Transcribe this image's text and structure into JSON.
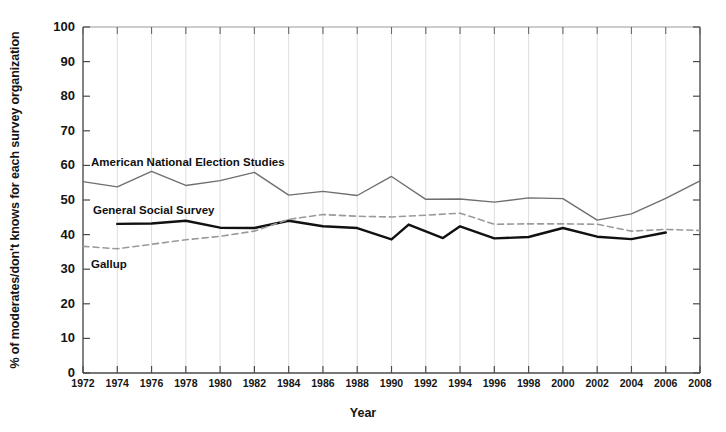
{
  "chart_data": {
    "type": "line",
    "title": "",
    "xlabel": "Year",
    "ylabel": "% of moderates/don't knows for each survey organization",
    "xlim": [
      1972,
      2008
    ],
    "ylim": [
      0,
      100
    ],
    "grid": "vertical-only",
    "legend_position": "inline-annotations",
    "x_tick_labels": [
      "1972",
      "1974",
      "1976",
      "1978",
      "1980",
      "1982",
      "1984",
      "1986",
      "1988",
      "1990",
      "1992",
      "1994",
      "1996",
      "1998",
      "2000",
      "2002",
      "2004",
      "2006",
      "2008"
    ],
    "y_tick_labels": [
      "0",
      "10",
      "20",
      "30",
      "40",
      "50",
      "60",
      "70",
      "80",
      "90",
      "100"
    ],
    "series": [
      {
        "name": "American National Election Studies",
        "style": "solid-thin",
        "color": "#6f6f6f",
        "x": [
          1972,
          1974,
          1976,
          1978,
          1980,
          1982,
          1984,
          1986,
          1988,
          1990,
          1992,
          1994,
          1996,
          1998,
          2000,
          2002,
          2004,
          2006,
          2008
        ],
        "values": [
          55.3,
          53.8,
          58.3,
          54.2,
          55.6,
          58.0,
          51.4,
          52.5,
          51.3,
          56.8,
          50.2,
          50.3,
          49.4,
          50.6,
          50.4,
          44.2,
          46.0,
          50.5,
          55.5
        ]
      },
      {
        "name": "General Social Survey",
        "style": "solid-thick",
        "color": "#111111",
        "x": [
          1974,
          1976,
          1978,
          1980,
          1982,
          1984,
          1986,
          1988,
          1990,
          1991,
          1993,
          1994,
          1996,
          1998,
          2000,
          2002,
          2004,
          2006
        ],
        "values": [
          43.1,
          43.2,
          44.0,
          42.0,
          41.9,
          44.0,
          42.4,
          41.9,
          38.6,
          42.9,
          39.0,
          42.4,
          38.9,
          39.3,
          41.9,
          39.4,
          38.7,
          40.6
        ],
        "note": "black solid line, annual-to-biennial points 1974-2006"
      },
      {
        "name": "Gallup",
        "style": "dashed",
        "color": "#9a9a9a",
        "x": [
          1972,
          1974,
          1976,
          1978,
          1980,
          1982,
          1984,
          1986,
          1988,
          1990,
          1992,
          1994,
          1996,
          1998,
          2000,
          2002,
          2004,
          2006,
          2008
        ],
        "values": [
          36.6,
          35.9,
          37.2,
          38.5,
          39.5,
          41.0,
          44.4,
          45.8,
          45.3,
          45.1,
          45.6,
          46.2,
          43.0,
          43.1,
          43.1,
          43.0,
          41.0,
          41.5,
          41.2
        ]
      }
    ],
    "annotations": [
      {
        "text": "American National Election Studies",
        "x_px": 91,
        "y_px": 156
      },
      {
        "text": "General Social Survey",
        "x_px": 93,
        "y_px": 204
      },
      {
        "text": "Gallup",
        "x_px": 91,
        "y_px": 258
      }
    ]
  },
  "axes": {
    "x_title": "Year",
    "y_title": "% of moderates/don't knows for each survey organization"
  }
}
